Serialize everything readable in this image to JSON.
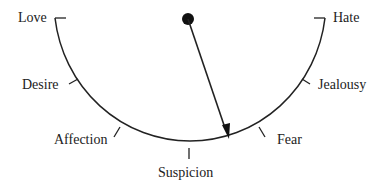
{
  "diagram": {
    "type": "dial-gauge",
    "scale_labels": [
      {
        "id": "love",
        "label": "Love"
      },
      {
        "id": "desire",
        "label": "Desire"
      },
      {
        "id": "affection",
        "label": "Affection"
      },
      {
        "id": "suspicion",
        "label": "Suspicion"
      },
      {
        "id": "fear",
        "label": "Fear"
      },
      {
        "id": "jealousy",
        "label": "Jealousy"
      },
      {
        "id": "hate",
        "label": "Hate"
      }
    ],
    "needle": {
      "points_toward": "between Suspicion and Fear"
    },
    "colors": {
      "line": "#222222",
      "background": "#ffffff"
    }
  }
}
